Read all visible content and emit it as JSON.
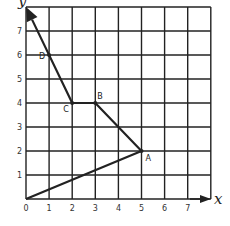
{
  "diagram": {
    "type": "coordinate-grid-path",
    "axes": {
      "x_label": "x",
      "y_label": "y",
      "x_ticks": [
        "0",
        "1",
        "2",
        "3",
        "4",
        "5",
        "6",
        "7"
      ],
      "y_ticks": [
        "1",
        "2",
        "3",
        "4",
        "5",
        "6",
        "7"
      ],
      "range": {
        "x": [
          0,
          8
        ],
        "y": [
          0,
          8
        ]
      }
    },
    "points": [
      {
        "label": "A",
        "x": 5,
        "y": 2
      },
      {
        "label": "B",
        "x": 3,
        "y": 4
      },
      {
        "label": "C",
        "x": 2,
        "y": 4
      },
      {
        "label": "D",
        "x": 1,
        "y": 6
      }
    ],
    "path": [
      [
        0,
        0
      ],
      [
        5,
        2
      ],
      [
        3,
        4
      ],
      [
        2,
        4
      ],
      [
        0,
        8
      ]
    ],
    "path_end_arrow": true
  }
}
